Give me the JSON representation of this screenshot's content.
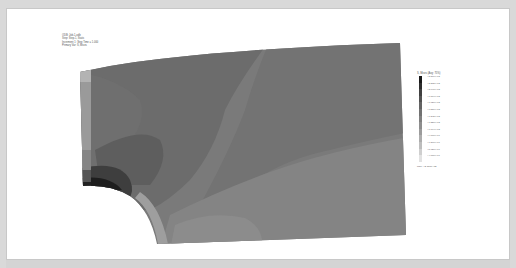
{
  "viewport": {
    "background": "#ffffff",
    "frame_color": "#c8c8c8"
  },
  "info_block": {
    "lines": [
      "ODB: Job-1.odb",
      "Step: Step-1, Static",
      "Increment 1: Step Time = 1.000",
      "Primary Var: S, Mises"
    ]
  },
  "legend": {
    "title": "S, Mises (Avg: 75%)",
    "entries": [
      {
        "label": "+2.376e+02",
        "color": "#1a1a1a"
      },
      {
        "label": "+2.212e+02",
        "color": "#2e2e2e"
      },
      {
        "label": "+2.048e+02",
        "color": "#404040"
      },
      {
        "label": "+1.884e+02",
        "color": "#525252"
      },
      {
        "label": "+1.720e+02",
        "color": "#646464"
      },
      {
        "label": "+1.556e+02",
        "color": "#727272"
      },
      {
        "label": "+1.392e+02",
        "color": "#808080"
      },
      {
        "label": "+1.228e+02",
        "color": "#8e8e8e"
      },
      {
        "label": "+1.064e+02",
        "color": "#9c9c9c"
      },
      {
        "label": "+9.000e+01",
        "color": "#adadad"
      },
      {
        "label": "+7.360e+01",
        "color": "#bdbdbd"
      },
      {
        "label": "+5.720e+01",
        "color": "#cfcfcf"
      },
      {
        "label": "+4.080e+01",
        "color": "#e2e2e2"
      }
    ],
    "footer": "Max: +2.376e+02"
  },
  "contour_colors": {
    "base": "#7a7a7a",
    "upper_dark": "#6a6a6a",
    "lower_light": "#878787",
    "edge_light": "#9a9a9a",
    "hotspot": "#1e1e1e"
  }
}
